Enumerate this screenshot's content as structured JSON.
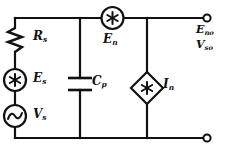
{
  "diagram": {
    "background_color": "#ffffff",
    "line_color": "#111111"
  },
  "components": {
    "resistor_source": {
      "symbol": "resistor-zigzag",
      "label_main": "R",
      "label_sub": "s"
    },
    "noise_voltage_source": {
      "symbol": "circle-asterisk-source",
      "label_main": "E",
      "label_sub": "s"
    },
    "signal_source": {
      "symbol": "circle-sine-ac-source",
      "label_main": "V",
      "label_sub": "s"
    },
    "shunt_capacitor": {
      "symbol": "capacitor-parallel-plates",
      "label_main": "C",
      "label_sub": "p"
    },
    "series_noise_source": {
      "symbol": "circle-asterisk-source",
      "label_main": "E",
      "label_sub": "n"
    },
    "shunt_noise_current_source": {
      "symbol": "diamond-asterisk-source",
      "label_main": "I",
      "label_sub": "n"
    }
  },
  "terminals": {
    "top": {
      "symbol": "open-circle-terminal",
      "label_main": "E",
      "label_sub": "no"
    },
    "bottom": {
      "symbol": "open-circle-terminal",
      "label_main": "V",
      "label_sub": "so"
    }
  }
}
